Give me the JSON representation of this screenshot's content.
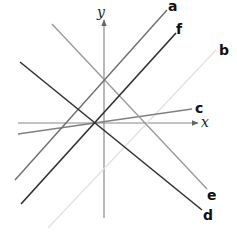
{
  "diagram": {
    "title": "",
    "axes": {
      "x_label": "x",
      "y_label": "y",
      "color": "#888888"
    },
    "lines": [
      {
        "name": "a",
        "label": "a",
        "color": "#6e6e6e",
        "width": 1.4
      },
      {
        "name": "f",
        "label": "f",
        "color": "#2e2e2e",
        "width": 1.6
      },
      {
        "name": "b",
        "label": "b",
        "color": "#e4e4e4",
        "width": 1.2
      },
      {
        "name": "c",
        "label": "c",
        "color": "#808080",
        "width": 1.3
      },
      {
        "name": "d",
        "label": "d",
        "color": "#333333",
        "width": 1.6
      },
      {
        "name": "e",
        "label": "e",
        "color": "#9a9a9a",
        "width": 1.4
      }
    ]
  }
}
